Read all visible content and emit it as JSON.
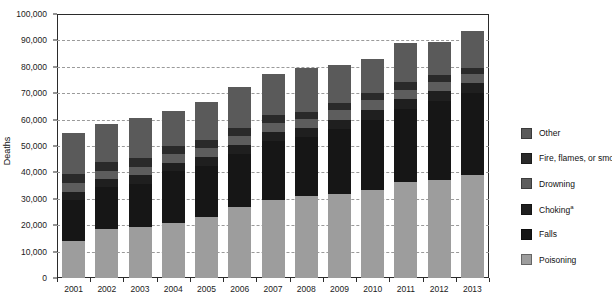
{
  "chart_data": {
    "type": "bar",
    "stacked": true,
    "title": "",
    "subtitle": "",
    "xlabel": "",
    "ylabel": "Deaths",
    "ylim": [
      0,
      100000
    ],
    "ytick_values": [
      0,
      10000,
      20000,
      30000,
      40000,
      50000,
      60000,
      70000,
      80000,
      90000,
      100000
    ],
    "ytick_labels": [
      "0",
      "10,000",
      "20,000",
      "30,000",
      "40,000",
      "50,000",
      "60,000",
      "70,000",
      "80,000",
      "90,000",
      "100,000"
    ],
    "grid": true,
    "grid_style": "dashed horizontal",
    "legend_position": "right",
    "categories": [
      "2001",
      "2002",
      "2003",
      "2004",
      "2005",
      "2006",
      "2007",
      "2008",
      "2009",
      "2010",
      "2011",
      "2012",
      "2013"
    ],
    "series": [
      {
        "name": "Poisoning",
        "color": "#9d9d9d",
        "values": [
          14000,
          18500,
          19500,
          20900,
          23000,
          27000,
          29500,
          31000,
          31800,
          33500,
          36500,
          37000,
          38900
        ]
      },
      {
        "name": "Falls",
        "color": "#161616",
        "values": [
          15700,
          15900,
          16300,
          19500,
          19600,
          20000,
          22400,
          22400,
          24700,
          26500,
          27600,
          30000,
          31000
        ]
      },
      {
        "name": "Choking",
        "color": "#1f1f1f",
        "values": [
          3000,
          3000,
          3100,
          3200,
          3200,
          3300,
          3400,
          3400,
          3500,
          3600,
          3700,
          3800,
          3900
        ]
      },
      {
        "name": "Drowning",
        "color": "#5d5d5d",
        "values": [
          3300,
          3200,
          3300,
          3400,
          3400,
          3500,
          3500,
          3400,
          3500,
          3800,
          3600,
          3400,
          3400
        ]
      },
      {
        "name": "Fire, flames, or smoke",
        "color": "#2a2a2a",
        "values": [
          3300,
          3200,
          3200,
          3100,
          3100,
          3000,
          3000,
          2800,
          2700,
          2800,
          2700,
          2600,
          2500
        ]
      },
      {
        "name": "Other",
        "color": "#5a5a5a",
        "values": [
          15700,
          14700,
          15100,
          13300,
          14200,
          15700,
          15500,
          16600,
          14400,
          12800,
          14800,
          12700,
          13800
        ]
      }
    ],
    "totals": [
      55000,
      58500,
      60500,
      63400,
      66500,
      72500,
      77300,
      79600,
      80600,
      83000,
      88900,
      89500,
      93500
    ]
  },
  "legend": {
    "items": [
      {
        "label": "Other",
        "color": "#5a5a5a"
      },
      {
        "label": "Fire, flames, or smoke",
        "color": "#2a2a2a"
      },
      {
        "label": "Drowning",
        "color": "#5d5d5d"
      },
      {
        "label": "Choking",
        "color": "#1f1f1f",
        "footnote": "a"
      },
      {
        "label": "Falls",
        "color": "#161616"
      },
      {
        "label": "Poisoning",
        "color": "#9d9d9d"
      }
    ]
  },
  "axes": {
    "y_label": "Deaths"
  }
}
